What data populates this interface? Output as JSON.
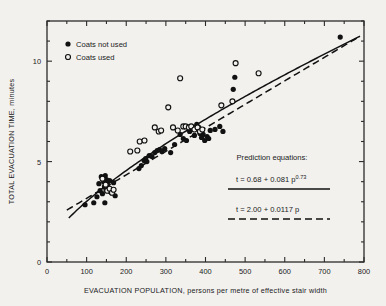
{
  "chart_data": {
    "type": "scatter",
    "title": "",
    "xlabel": "EVACUATION POPULATION, persons per metre of effective stair width",
    "ylabel": "TOTAL EVACUATION TIME, minutes",
    "xlim": [
      0,
      800
    ],
    "ylim": [
      0,
      12
    ],
    "x_ticks": [
      0,
      100,
      200,
      300,
      400,
      500,
      600,
      700,
      800
    ],
    "x_minor_step": 50,
    "y_ticks": [
      0,
      5,
      10
    ],
    "y_minor_step": 1,
    "grid": false,
    "legend_position": "top-left",
    "series": [
      {
        "name": "Coats not used",
        "marker": "filled-circle",
        "points": [
          [
            96,
            2.85
          ],
          [
            118,
            2.95
          ],
          [
            126,
            3.25
          ],
          [
            131,
            3.9
          ],
          [
            134,
            3.55
          ],
          [
            137,
            4.25
          ],
          [
            140,
            3.4
          ],
          [
            143,
            4.0
          ],
          [
            145,
            3.75
          ],
          [
            147,
            4.3
          ],
          [
            149,
            3.6
          ],
          [
            150,
            4.1
          ],
          [
            152,
            3.85
          ],
          [
            155,
            3.7
          ],
          [
            158,
            4.05
          ],
          [
            160,
            3.5
          ],
          [
            146,
            2.95
          ],
          [
            163,
            3.45
          ],
          [
            168,
            3.95
          ],
          [
            172,
            3.3
          ],
          [
            232,
            4.65
          ],
          [
            238,
            4.8
          ],
          [
            245,
            5.05
          ],
          [
            249,
            5.15
          ],
          [
            252,
            5.0
          ],
          [
            258,
            5.3
          ],
          [
            265,
            5.25
          ],
          [
            272,
            5.45
          ],
          [
            278,
            5.55
          ],
          [
            284,
            5.6
          ],
          [
            290,
            5.5
          ],
          [
            297,
            5.65
          ],
          [
            312,
            5.45
          ],
          [
            322,
            5.85
          ],
          [
            336,
            6.35
          ],
          [
            344,
            6.15
          ],
          [
            352,
            6.05
          ],
          [
            360,
            6.5
          ],
          [
            368,
            6.6
          ],
          [
            372,
            6.3
          ],
          [
            378,
            6.85
          ],
          [
            383,
            6.7
          ],
          [
            386,
            6.4
          ],
          [
            390,
            6.2
          ],
          [
            394,
            6.35
          ],
          [
            398,
            6.05
          ],
          [
            404,
            6.25
          ],
          [
            408,
            6.15
          ],
          [
            412,
            6.55
          ],
          [
            424,
            6.6
          ],
          [
            436,
            6.75
          ],
          [
            444,
            6.5
          ],
          [
            470,
            8.6
          ],
          [
            474,
            9.2
          ],
          [
            740,
            11.2
          ]
        ]
      },
      {
        "name": "Coats used",
        "marker": "open-circle",
        "points": [
          [
            140,
            4.15
          ],
          [
            148,
            3.85
          ],
          [
            152,
            3.55
          ],
          [
            158,
            3.65
          ],
          [
            164,
            3.45
          ],
          [
            168,
            3.6
          ],
          [
            210,
            5.5
          ],
          [
            228,
            5.55
          ],
          [
            234,
            6.0
          ],
          [
            246,
            6.05
          ],
          [
            272,
            6.7
          ],
          [
            282,
            6.5
          ],
          [
            288,
            6.55
          ],
          [
            306,
            7.7
          ],
          [
            318,
            6.7
          ],
          [
            330,
            6.55
          ],
          [
            336,
            9.15
          ],
          [
            344,
            6.75
          ],
          [
            350,
            6.75
          ],
          [
            358,
            6.7
          ],
          [
            364,
            6.75
          ],
          [
            372,
            6.6
          ],
          [
            380,
            6.7
          ],
          [
            386,
            6.5
          ],
          [
            392,
            6.6
          ],
          [
            440,
            7.8
          ],
          [
            468,
            8.0
          ],
          [
            476,
            9.9
          ],
          [
            534,
            9.4
          ]
        ]
      }
    ],
    "curves": [
      {
        "name": "power-law-fit",
        "style": "solid",
        "equation": "t = 0.68 + 0.081 p^0.73",
        "intercept": 0.68,
        "coefficient": 0.081,
        "exponent": 0.73,
        "x_range": [
          55,
          790
        ]
      },
      {
        "name": "linear-fit",
        "style": "dashed",
        "equation": "t = 2.00 + 0.0117 p",
        "intercept": 2.0,
        "slope": 0.0117,
        "x_range": [
          50,
          790
        ]
      }
    ]
  },
  "legend": {
    "items": [
      {
        "label": "Coats not used",
        "marker": "filled-circle"
      },
      {
        "label": "Coats used",
        "marker": "open-circle"
      }
    ]
  },
  "annotations": {
    "heading": "Prediction equations:",
    "equation_1_main": "t = 0.68 + 0.081 p",
    "equation_1_exponent": "0.73",
    "equation_2": "t = 2.00 + 0.0117 p"
  },
  "axes": {
    "x_title": "EVACUATION POPULATION, persons per metre of effective stair width",
    "y_title": "TOTAL EVACUATION TIME, minutes",
    "x_tick_labels": [
      "0",
      "100",
      "200",
      "300",
      "400",
      "500",
      "600",
      "700",
      "800"
    ],
    "y_tick_labels": [
      "0",
      "5",
      "10"
    ]
  },
  "colors": {
    "background": "#f2f1ee",
    "ink": "#111111",
    "axis": "#2b2b2b"
  }
}
